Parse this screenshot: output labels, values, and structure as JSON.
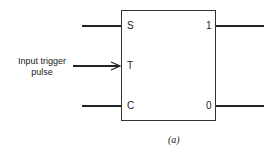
{
  "diagram": {
    "inputs": [
      {
        "label": "S"
      },
      {
        "label": "T"
      },
      {
        "label": "C"
      }
    ],
    "outputs": [
      {
        "label": "1"
      },
      {
        "label": "0"
      }
    ],
    "trigger_label_line1": "Input trigger",
    "trigger_label_line2": "pulse",
    "caption": "(a)"
  }
}
